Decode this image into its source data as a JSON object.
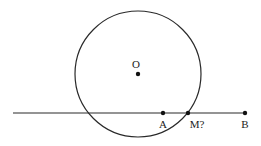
{
  "diagram": {
    "circle": {
      "center_label": "O",
      "cx": 138,
      "cy": 74,
      "r": 63
    },
    "line": {
      "x1": 13,
      "y1": 113,
      "x2": 245,
      "y2": 113
    },
    "points": [
      {
        "id": "O",
        "label": "O",
        "x": 138,
        "y": 74
      },
      {
        "id": "A",
        "label": "A",
        "x": 163,
        "y": 113
      },
      {
        "id": "M",
        "label": "M?",
        "x": 188,
        "y": 113
      },
      {
        "id": "B",
        "label": "B",
        "x": 245,
        "y": 113
      }
    ],
    "stroke_color": "#2a2a2a"
  }
}
